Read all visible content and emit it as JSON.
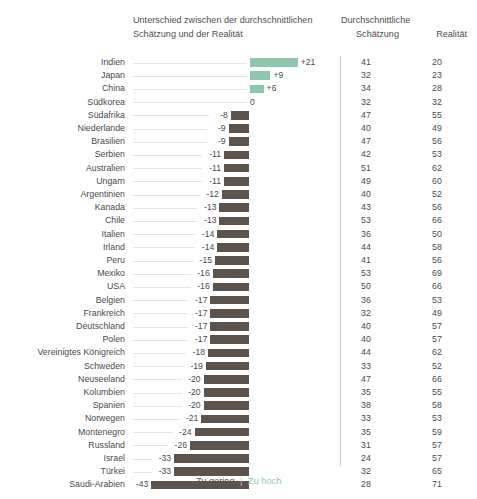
{
  "header": {
    "difference_title_line1": "Unterschied zwischen der durchschnittlichen",
    "difference_title_line2": "Schätzung und der Realität",
    "estimate_title_line1": "Durchschnittliche",
    "estimate_title_line2": "Schätzung",
    "reality_title": "Realität"
  },
  "legend": {
    "too_low": "Zu gering",
    "separator": "|",
    "too_high": "Zu hoch"
  },
  "colors": {
    "positive_bar": "#8cc7ae",
    "negative_bar": "#5b534c",
    "divider": "#c9c9c9",
    "leader_line": "#e4e4e4",
    "text": "#4a4a4a"
  },
  "chart_data": {
    "type": "bar",
    "title": "Unterschied zwischen der durchschnittlichen Schätzung und der Realität",
    "xlabel": "",
    "ylabel": "",
    "orientation": "horizontal",
    "grid": false,
    "legend_position": "bottom",
    "zero_reference": 0,
    "value_range": [
      -43,
      21
    ],
    "categories": [
      "Indien",
      "Japan",
      "China",
      "Südkorea",
      "Südafrika",
      "Niederlande",
      "Brasilien",
      "Serbien",
      "Australien",
      "Ungarn",
      "Argentinien",
      "Kanada",
      "Chile",
      "Italien",
      "Irland",
      "Peru",
      "Mexiko",
      "USA",
      "Belgien",
      "Frankreich",
      "Deutschland",
      "Polen",
      "Vereinigtes Königreich",
      "Schweden",
      "Neuseeland",
      "Kolumbien",
      "Spanien",
      "Norwegen",
      "Montenegro",
      "Russland",
      "Israel",
      "Türkei",
      "Saudi-Arabien"
    ],
    "series": [
      {
        "name": "Unterschied zwischen der durchschnittlichen Schätzung und der Realität",
        "values": [
          21,
          9,
          6,
          0,
          -8,
          -9,
          -9,
          -11,
          -11,
          -11,
          -12,
          -13,
          -13,
          -14,
          -14,
          -15,
          -16,
          -16,
          -17,
          -17,
          -17,
          -17,
          -18,
          -19,
          -20,
          -20,
          -20,
          -21,
          -24,
          -26,
          -33,
          -33,
          -43
        ]
      },
      {
        "name": "Durchschnittliche Schätzung",
        "values": [
          41,
          32,
          34,
          32,
          47,
          40,
          47,
          42,
          51,
          49,
          40,
          43,
          53,
          36,
          44,
          41,
          53,
          50,
          36,
          32,
          40,
          40,
          44,
          33,
          47,
          35,
          38,
          33,
          35,
          31,
          24,
          32,
          28
        ]
      },
      {
        "name": "Realität",
        "values": [
          20,
          23,
          28,
          32,
          55,
          49,
          56,
          53,
          62,
          60,
          52,
          56,
          66,
          50,
          58,
          56,
          69,
          66,
          53,
          49,
          57,
          57,
          62,
          52,
          66,
          55,
          58,
          53,
          59,
          57,
          57,
          65,
          71
        ]
      }
    ],
    "rows": [
      {
        "country": "Indien",
        "difference": 21,
        "difference_label": "+21",
        "estimate": 41,
        "reality": 20
      },
      {
        "country": "Japan",
        "difference": 9,
        "difference_label": "+9",
        "estimate": 32,
        "reality": 23
      },
      {
        "country": "China",
        "difference": 6,
        "difference_label": "+6",
        "estimate": 34,
        "reality": 28
      },
      {
        "country": "Südkorea",
        "difference": 0,
        "difference_label": "0",
        "estimate": 32,
        "reality": 32
      },
      {
        "country": "Südafrika",
        "difference": -8,
        "difference_label": "-8",
        "estimate": 47,
        "reality": 55
      },
      {
        "country": "Niederlande",
        "difference": -9,
        "difference_label": "-9",
        "estimate": 40,
        "reality": 49
      },
      {
        "country": "Brasilien",
        "difference": -9,
        "difference_label": "-9",
        "estimate": 47,
        "reality": 56
      },
      {
        "country": "Serbien",
        "difference": -11,
        "difference_label": "-11",
        "estimate": 42,
        "reality": 53
      },
      {
        "country": "Australien",
        "difference": -11,
        "difference_label": "-11",
        "estimate": 51,
        "reality": 62
      },
      {
        "country": "Ungarn",
        "difference": -11,
        "difference_label": "-11",
        "estimate": 49,
        "reality": 60
      },
      {
        "country": "Argentinien",
        "difference": -12,
        "difference_label": "-12",
        "estimate": 40,
        "reality": 52
      },
      {
        "country": "Kanada",
        "difference": -13,
        "difference_label": "-13",
        "estimate": 43,
        "reality": 56
      },
      {
        "country": "Chile",
        "difference": -13,
        "difference_label": "-13",
        "estimate": 53,
        "reality": 66
      },
      {
        "country": "Italien",
        "difference": -14,
        "difference_label": "-14",
        "estimate": 36,
        "reality": 50
      },
      {
        "country": "Irland",
        "difference": -14,
        "difference_label": "-14",
        "estimate": 44,
        "reality": 58
      },
      {
        "country": "Peru",
        "difference": -15,
        "difference_label": "-15",
        "estimate": 41,
        "reality": 56
      },
      {
        "country": "Mexiko",
        "difference": -16,
        "difference_label": "-16",
        "estimate": 53,
        "reality": 69
      },
      {
        "country": "USA",
        "difference": -16,
        "difference_label": "-16",
        "estimate": 50,
        "reality": 66
      },
      {
        "country": "Belgien",
        "difference": -17,
        "difference_label": "-17",
        "estimate": 36,
        "reality": 53
      },
      {
        "country": "Frankreich",
        "difference": -17,
        "difference_label": "-17",
        "estimate": 32,
        "reality": 49
      },
      {
        "country": "Deutschland",
        "difference": -17,
        "difference_label": "-17",
        "estimate": 40,
        "reality": 57
      },
      {
        "country": "Polen",
        "difference": -17,
        "difference_label": "-17",
        "estimate": 40,
        "reality": 57
      },
      {
        "country": "Vereinigtes Königreich",
        "difference": -18,
        "difference_label": "-18",
        "estimate": 44,
        "reality": 62
      },
      {
        "country": "Schweden",
        "difference": -19,
        "difference_label": "-19",
        "estimate": 33,
        "reality": 52
      },
      {
        "country": "Neuseeland",
        "difference": -20,
        "difference_label": "-20",
        "estimate": 47,
        "reality": 66
      },
      {
        "country": "Kolumbien",
        "difference": -20,
        "difference_label": "-20",
        "estimate": 35,
        "reality": 55
      },
      {
        "country": "Spanien",
        "difference": -20,
        "difference_label": "-20",
        "estimate": 38,
        "reality": 58
      },
      {
        "country": "Norwegen",
        "difference": -21,
        "difference_label": "-21",
        "estimate": 33,
        "reality": 53
      },
      {
        "country": "Montenegro",
        "difference": -24,
        "difference_label": "-24",
        "estimate": 35,
        "reality": 59
      },
      {
        "country": "Russland",
        "difference": -26,
        "difference_label": "-26",
        "estimate": 31,
        "reality": 57
      },
      {
        "country": "Israel",
        "difference": -33,
        "difference_label": "-33",
        "estimate": 24,
        "reality": 57
      },
      {
        "country": "Türkei",
        "difference": -33,
        "difference_label": "-33",
        "estimate": 32,
        "reality": 65
      },
      {
        "country": "Saudi-Arabien",
        "difference": -43,
        "difference_label": "-43",
        "estimate": 28,
        "reality": 71
      }
    ]
  }
}
